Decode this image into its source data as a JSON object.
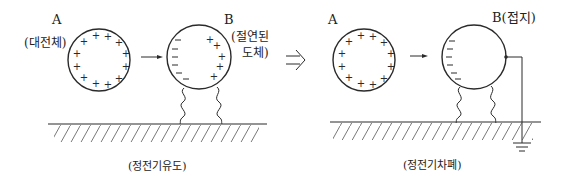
{
  "diagram": {
    "left_panel": {
      "label_a": "A",
      "label_a_desc": "(대전체)",
      "label_b": "B",
      "label_b_desc_line1": "(절연된",
      "label_b_desc_line2": "도체)",
      "caption": "(정전기유도)",
      "sphere_a_charges": "+",
      "sphere_b_near_charges": "−",
      "sphere_b_far_charges": "+"
    },
    "transition_arrow": "⇒",
    "right_panel": {
      "label_a": "A",
      "label_b": "B(접지)",
      "caption": "(정전기차폐)",
      "sphere_a_charges": "+",
      "sphere_b_near_charges": "−"
    },
    "colors": {
      "line": "#2a2a2a",
      "background": "#ffffff"
    }
  }
}
